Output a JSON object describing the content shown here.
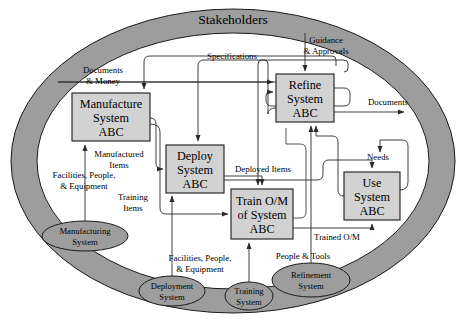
{
  "diagram": {
    "title": "Stakeholders",
    "colors": {
      "band": "#9d9d9d",
      "band_stroke": "#1a1a1a",
      "box_fill": "#d2d2d2",
      "box_stroke": "#1a1a1a",
      "ellipse_fill": "#9d9d9d",
      "line": "#2a2a2a",
      "background": "#ffffff"
    },
    "environment_band": {
      "label": "Stakeholders",
      "shape": "ellipse-ring"
    },
    "processes": [
      {
        "id": "manufacture",
        "lines": [
          "Manufacture",
          "System",
          "ABC"
        ],
        "x": 72,
        "y": 93,
        "w": 78,
        "h": 48
      },
      {
        "id": "deploy",
        "lines": [
          "Deploy",
          "System",
          "ABC"
        ],
        "x": 166,
        "y": 145,
        "w": 58,
        "h": 48
      },
      {
        "id": "refine",
        "lines": [
          "Refine",
          "System",
          "ABC"
        ],
        "x": 276,
        "y": 74,
        "w": 58,
        "h": 48
      },
      {
        "id": "train",
        "lines": [
          "Train O/M",
          "of System",
          "ABC"
        ],
        "x": 231,
        "y": 189,
        "w": 62,
        "h": 50
      },
      {
        "id": "use",
        "lines": [
          "Use",
          "System",
          "ABC"
        ],
        "x": 344,
        "y": 172,
        "w": 56,
        "h": 48
      }
    ],
    "enabling_systems": [
      {
        "id": "manufacturing-system",
        "lines": [
          "Manufacturing",
          "System"
        ],
        "cx": 85,
        "cy": 236,
        "rx": 43,
        "ry": 15
      },
      {
        "id": "deployment-system",
        "lines": [
          "Deployment",
          "System"
        ],
        "cx": 172,
        "cy": 291,
        "rx": 33,
        "ry": 15
      },
      {
        "id": "training-system",
        "lines": [
          "Training",
          "System"
        ],
        "cx": 249,
        "cy": 296,
        "rx": 24,
        "ry": 14
      },
      {
        "id": "refinement-system",
        "lines": [
          "Refinement",
          "System"
        ],
        "cx": 311,
        "cy": 280,
        "rx": 39,
        "ry": 17
      }
    ],
    "flow_labels": [
      {
        "id": "documents-money",
        "lines": [
          "Documents",
          "& Money"
        ],
        "x": 103,
        "y": 73,
        "anchor": "middle"
      },
      {
        "id": "specifications",
        "lines": [
          "Specifications"
        ],
        "x": 232,
        "y": 59,
        "anchor": "middle"
      },
      {
        "id": "guidance-approvals",
        "lines": [
          "Guidance",
          "& Approvals"
        ],
        "x": 326,
        "y": 43,
        "anchor": "middle"
      },
      {
        "id": "documents-out",
        "lines": [
          "Documents"
        ],
        "x": 388,
        "y": 105,
        "anchor": "middle"
      },
      {
        "id": "manufactured-items",
        "lines": [
          "Manufactured",
          "Items"
        ],
        "x": 119,
        "y": 157,
        "anchor": "middle"
      },
      {
        "id": "facilities-people-1",
        "lines": [
          "Facilities, People,",
          "& Equipment"
        ],
        "x": 84,
        "y": 178,
        "anchor": "middle"
      },
      {
        "id": "training-items",
        "lines": [
          "Training",
          "Items"
        ],
        "x": 133,
        "y": 200,
        "anchor": "middle"
      },
      {
        "id": "deployed-items",
        "lines": [
          "Deployed Items"
        ],
        "x": 263,
        "y": 172,
        "anchor": "middle"
      },
      {
        "id": "needs",
        "lines": [
          "Needs"
        ],
        "x": 378,
        "y": 160,
        "anchor": "middle"
      },
      {
        "id": "trained-om",
        "lines": [
          "Trained O/M"
        ],
        "x": 337,
        "y": 240,
        "anchor": "middle"
      },
      {
        "id": "facilities-people-2",
        "lines": [
          "Facilities, People,",
          "& Equipment"
        ],
        "x": 200,
        "y": 261,
        "anchor": "middle"
      },
      {
        "id": "people-tools",
        "lines": [
          "People & Tools"
        ],
        "x": 303,
        "y": 259,
        "anchor": "middle"
      }
    ],
    "connections": [
      {
        "from": "stakeholders",
        "to": "manufacture",
        "label": "Documents & Money"
      },
      {
        "from": "refine",
        "to": "manufacture",
        "label": "Specifications"
      },
      {
        "from": "refine",
        "to": "deploy",
        "label": "Specifications"
      },
      {
        "from": "refine",
        "to": "train",
        "label": "Specifications"
      },
      {
        "from": "stakeholders",
        "to": "refine",
        "label": "Guidance & Approvals"
      },
      {
        "from": "refine",
        "to": "stakeholders",
        "label": "Documents"
      },
      {
        "from": "manufacturing-system",
        "to": "manufacture",
        "label": "Facilities, People, & Equipment"
      },
      {
        "from": "manufacture",
        "to": "deploy",
        "label": "Manufactured Items"
      },
      {
        "from": "manufacture",
        "to": "train",
        "label": "Training Items"
      },
      {
        "from": "deployment-system",
        "to": "deploy",
        "label": "Facilities, People, & Equipment"
      },
      {
        "from": "deploy",
        "to": "train",
        "label": "Deployed Items"
      },
      {
        "from": "deploy",
        "to": "use",
        "label": "Deployed Items"
      },
      {
        "from": "training-system",
        "to": "train",
        "label": "Facilities, People, & Equipment"
      },
      {
        "from": "train",
        "to": "use",
        "label": "Trained O/M"
      },
      {
        "from": "use",
        "to": "refine",
        "label": "Needs"
      },
      {
        "from": "refine",
        "to": "use",
        "label": "Needs"
      },
      {
        "from": "refinement-system",
        "to": "refine",
        "label": "People & Tools"
      }
    ]
  }
}
